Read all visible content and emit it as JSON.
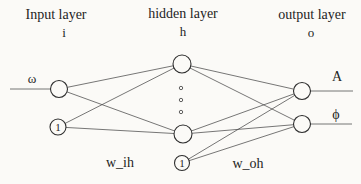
{
  "colors": {
    "background": "#fbfaf7",
    "line": "#4a4a4a",
    "text": "#1e1e1e"
  },
  "layers": {
    "input": {
      "title": "Input layer",
      "symbol": "i"
    },
    "hidden": {
      "title": "hidden layer",
      "symbol": "h"
    },
    "output": {
      "title": "output layer",
      "symbol": "o"
    }
  },
  "nodes": {
    "input_signal_label": "ω",
    "input_bias_label": "1",
    "hidden_bias_label": "1",
    "output_amplitude_label": "A",
    "output_phase_label": "ϕ"
  },
  "weights": {
    "input_hidden_label": "w_ih",
    "hidden_output_label": "w_oh"
  }
}
